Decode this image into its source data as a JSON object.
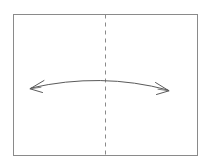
{
  "figure": {
    "kind": "fold-symmetry-diagram",
    "background_color": "#ffffff",
    "canvas": {
      "width": 212,
      "height": 165
    }
  },
  "sheet": {
    "name": "paper-sheet",
    "stroke_color": "#8a8a8a",
    "fill_color": "#ffffff",
    "stroke_width": 1,
    "x": 13,
    "y": 14,
    "width": 184,
    "height": 141
  },
  "fold_line": {
    "name": "vertical-fold-line",
    "style": "dashed",
    "stroke_color": "#8a8a8a",
    "stroke_width": 1,
    "dash_pattern": "4 4",
    "x": 105,
    "y_start": 14,
    "y_end": 155
  },
  "fold_arrow": {
    "name": "double-headed-fold-arrow",
    "style": "curved",
    "heads": "both",
    "stroke_color": "#5a5a5a",
    "stroke_width": 1,
    "left_tip": {
      "x": 30,
      "y": 89
    },
    "right_tip": {
      "x": 169,
      "y": 91
    },
    "apex": {
      "x": 101,
      "y": 78
    },
    "path": "M 31 88 Q 101 72 168 90"
  },
  "labels": {
    "none_visible": ""
  }
}
